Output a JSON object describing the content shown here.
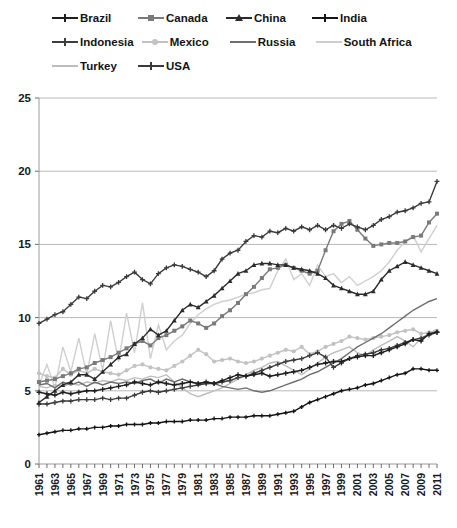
{
  "chart_data": {
    "type": "line",
    "title": "",
    "xlabel": "",
    "ylabel": "",
    "ylim": [
      0,
      25
    ],
    "yticks": [
      0,
      5,
      10,
      15,
      20,
      25
    ],
    "grid": true,
    "legend_position": "top",
    "x": [
      1961,
      1962,
      1963,
      1964,
      1965,
      1966,
      1967,
      1968,
      1969,
      1970,
      1971,
      1972,
      1973,
      1974,
      1975,
      1976,
      1977,
      1978,
      1979,
      1980,
      1981,
      1982,
      1983,
      1984,
      1985,
      1986,
      1987,
      1988,
      1989,
      1990,
      1991,
      1992,
      1993,
      1994,
      1995,
      1996,
      1997,
      1998,
      1999,
      2000,
      2001,
      2002,
      2003,
      2004,
      2005,
      2006,
      2007,
      2008,
      2009,
      2010,
      2011
    ],
    "xtick_labels": [
      "1961",
      "1963",
      "1965",
      "1967",
      "1969",
      "1971",
      "1973",
      "1975",
      "1977",
      "1979",
      "1981",
      "1983",
      "1985",
      "1987",
      "1989",
      "1991",
      "1993",
      "1995",
      "1997",
      "1999",
      "2001",
      "2003",
      "2005",
      "2007",
      "2009",
      "2011"
    ],
    "series": [
      {
        "name": "Brazil",
        "color": "#1f1f1f",
        "marker": "plus",
        "values": [
          4.9,
          4.8,
          4.7,
          4.9,
          4.8,
          4.9,
          5.0,
          5.0,
          5.1,
          5.2,
          5.3,
          5.4,
          5.6,
          5.5,
          5.4,
          5.6,
          5.5,
          5.4,
          5.5,
          5.6,
          5.5,
          5.6,
          5.5,
          5.7,
          5.9,
          6.1,
          6.0,
          6.1,
          6.2,
          6.0,
          6.1,
          6.2,
          6.3,
          6.4,
          6.6,
          6.8,
          6.9,
          7.0,
          7.0,
          7.2,
          7.3,
          7.4,
          7.4,
          7.6,
          7.8,
          8.0,
          8.2,
          8.5,
          8.4,
          8.9,
          9.0
        ]
      },
      {
        "name": "Canada",
        "color": "#7a7a7a",
        "marker": "square",
        "values": [
          5.6,
          5.7,
          5.8,
          6.0,
          6.2,
          6.5,
          6.6,
          6.9,
          7.1,
          7.3,
          7.6,
          7.9,
          8.2,
          8.4,
          8.1,
          8.6,
          8.8,
          9.1,
          9.4,
          9.8,
          9.6,
          9.3,
          9.6,
          10.1,
          10.5,
          11.0,
          11.6,
          12.1,
          12.7,
          13.3,
          13.4,
          13.6,
          13.4,
          13.2,
          13.0,
          13.2,
          14.6,
          15.9,
          16.4,
          16.6,
          16.0,
          15.4,
          14.9,
          15.0,
          15.1,
          15.1,
          15.2,
          15.5,
          15.6,
          16.5,
          17.1
        ]
      },
      {
        "name": "China",
        "color": "#2b2b2b",
        "marker": "triangle",
        "values": [
          4.2,
          4.6,
          5.0,
          5.4,
          5.6,
          6.1,
          6.1,
          5.8,
          6.3,
          6.8,
          7.3,
          7.5,
          8.2,
          8.6,
          9.2,
          8.8,
          9.1,
          9.8,
          10.5,
          10.9,
          10.7,
          11.1,
          11.5,
          12.0,
          12.5,
          13.0,
          13.2,
          13.6,
          13.7,
          13.7,
          13.6,
          13.6,
          13.4,
          13.3,
          13.2,
          13.0,
          12.7,
          12.2,
          12.0,
          11.8,
          11.6,
          11.6,
          11.8,
          12.6,
          13.2,
          13.5,
          13.8,
          13.6,
          13.4,
          13.2,
          13.0
        ]
      },
      {
        "name": "India",
        "color": "#141414",
        "marker": "plus-small",
        "values": [
          2.0,
          2.1,
          2.2,
          2.3,
          2.3,
          2.4,
          2.4,
          2.5,
          2.5,
          2.6,
          2.6,
          2.7,
          2.7,
          2.7,
          2.8,
          2.8,
          2.9,
          2.9,
          2.9,
          3.0,
          3.0,
          3.0,
          3.1,
          3.1,
          3.2,
          3.2,
          3.2,
          3.3,
          3.3,
          3.3,
          3.4,
          3.5,
          3.6,
          3.9,
          4.2,
          4.4,
          4.6,
          4.8,
          5.0,
          5.1,
          5.2,
          5.4,
          5.5,
          5.7,
          5.9,
          6.1,
          6.2,
          6.5,
          6.5,
          6.4,
          6.4
        ]
      },
      {
        "name": "Indonesia",
        "color": "#3d3d3d",
        "marker": "plus",
        "values": [
          4.1,
          4.1,
          4.2,
          4.3,
          4.3,
          4.4,
          4.4,
          4.4,
          4.5,
          4.4,
          4.5,
          4.5,
          4.7,
          4.9,
          5.0,
          4.9,
          5.0,
          5.1,
          5.2,
          5.3,
          5.4,
          5.5,
          5.5,
          5.6,
          5.7,
          5.9,
          6.0,
          6.2,
          6.4,
          6.6,
          6.8,
          7.0,
          7.1,
          7.2,
          7.4,
          7.6,
          7.3,
          6.6,
          6.9,
          7.2,
          7.4,
          7.5,
          7.6,
          7.8,
          7.9,
          8.1,
          8.3,
          8.5,
          8.6,
          8.8,
          9.0
        ]
      },
      {
        "name": "Mexico",
        "color": "#c2c2c2",
        "marker": "circle",
        "values": [
          6.2,
          6.0,
          5.9,
          6.5,
          6.1,
          6.4,
          6.2,
          6.5,
          6.3,
          6.2,
          6.1,
          6.4,
          6.7,
          6.8,
          6.6,
          6.5,
          6.4,
          6.7,
          7.0,
          7.4,
          7.8,
          7.5,
          7.0,
          7.1,
          7.2,
          7.0,
          6.9,
          7.0,
          7.2,
          7.4,
          7.6,
          7.8,
          7.7,
          8.0,
          7.5,
          7.7,
          8.0,
          8.2,
          8.4,
          8.7,
          8.6,
          8.5,
          8.6,
          8.7,
          8.8,
          9.0,
          9.1,
          9.2,
          8.9,
          9.0,
          9.1
        ]
      },
      {
        "name": "Russia",
        "color": "#6e6e6e",
        "marker": "none",
        "values": [
          5.4,
          5.5,
          5.2,
          5.6,
          5.4,
          5.6,
          5.3,
          5.6,
          5.4,
          5.6,
          5.5,
          5.6,
          5.5,
          5.7,
          5.8,
          5.5,
          5.8,
          5.6,
          5.8,
          5.6,
          5.5,
          5.6,
          5.5,
          5.3,
          5.2,
          5.1,
          5.2,
          5.0,
          4.9,
          5.0,
          5.2,
          5.4,
          5.6,
          5.8,
          6.1,
          6.3,
          6.6,
          6.9,
          7.2,
          7.6,
          8.0,
          8.3,
          8.6,
          8.9,
          9.3,
          9.7,
          10.1,
          10.5,
          10.8,
          11.1,
          11.3
        ]
      },
      {
        "name": "South Africa",
        "color": "#cfcfcf",
        "marker": "none",
        "values": [
          5.4,
          6.8,
          5.2,
          8.0,
          6.3,
          8.6,
          6.1,
          8.9,
          6.4,
          9.8,
          7.0,
          10.3,
          7.6,
          11.0,
          7.2,
          9.5,
          7.8,
          8.4,
          8.8,
          9.6,
          10.2,
          10.6,
          10.9,
          11.1,
          11.2,
          11.4,
          11.6,
          11.7,
          11.9,
          12.0,
          13.2,
          14.0,
          12.6,
          13.0,
          12.2,
          13.6,
          12.8,
          13.0,
          12.4,
          12.8,
          12.2,
          12.5,
          12.8,
          13.2,
          13.8,
          14.6,
          15.2,
          15.6,
          14.5,
          15.4,
          16.3
        ]
      },
      {
        "name": "Turkey",
        "color": "#bdbdbd",
        "marker": "none",
        "values": [
          5.3,
          5.2,
          5.4,
          5.3,
          5.5,
          5.4,
          5.6,
          5.5,
          5.7,
          5.6,
          5.8,
          5.7,
          5.9,
          5.8,
          6.0,
          5.9,
          6.1,
          5.6,
          5.2,
          4.8,
          4.6,
          4.8,
          5.0,
          5.2,
          5.5,
          5.8,
          6.1,
          6.4,
          6.6,
          6.9,
          7.0,
          6.7,
          6.4,
          6.1,
          6.5,
          6.9,
          7.3,
          7.6,
          7.8,
          8.0,
          7.6,
          7.4,
          7.8,
          8.1,
          8.4,
          8.7,
          8.4,
          8.0,
          8.6,
          8.9,
          9.2
        ]
      },
      {
        "name": "USA",
        "color": "#3a3a3a",
        "marker": "plus",
        "values": [
          9.6,
          9.9,
          10.2,
          10.4,
          10.9,
          11.4,
          11.3,
          11.8,
          12.2,
          12.1,
          12.4,
          12.8,
          13.1,
          12.6,
          12.3,
          13.0,
          13.4,
          13.6,
          13.5,
          13.3,
          13.1,
          12.8,
          13.2,
          14.0,
          14.4,
          14.6,
          15.2,
          15.6,
          15.5,
          15.9,
          15.8,
          16.1,
          15.9,
          16.2,
          16.0,
          16.3,
          16.0,
          16.3,
          16.1,
          16.4,
          16.2,
          16.0,
          16.3,
          16.7,
          16.9,
          17.2,
          17.3,
          17.5,
          17.8,
          17.9,
          19.3
        ]
      }
    ]
  },
  "legend": {
    "rows": [
      [
        {
          "label": "Brazil",
          "color": "#1f1f1f",
          "marker": "plus"
        },
        {
          "label": "Canada",
          "color": "#7a7a7a",
          "marker": "square"
        },
        {
          "label": "China",
          "color": "#2b2b2b",
          "marker": "triangle"
        },
        {
          "label": "India",
          "color": "#141414",
          "marker": "plus-small"
        }
      ],
      [
        {
          "label": "Indonesia",
          "color": "#3d3d3d",
          "marker": "plus"
        },
        {
          "label": "Mexico",
          "color": "#c2c2c2",
          "marker": "circle"
        },
        {
          "label": "Russia",
          "color": "#6e6e6e",
          "marker": "none"
        },
        {
          "label": "South Africa",
          "color": "#cfcfcf",
          "marker": "none"
        }
      ],
      [
        {
          "label": "Turkey",
          "color": "#bdbdbd",
          "marker": "none"
        },
        {
          "label": "USA",
          "color": "#3a3a3a",
          "marker": "plus"
        }
      ]
    ]
  }
}
